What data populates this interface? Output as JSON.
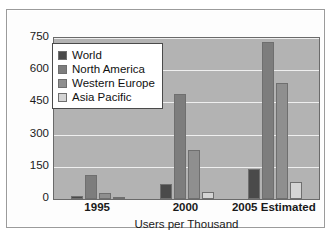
{
  "chart_data": {
    "type": "bar",
    "title": "",
    "xlabel": "Users per Thousand",
    "ylabel": "",
    "categories": [
      "1995",
      "2000",
      "2005 Estimated"
    ],
    "series": [
      {
        "name": "World",
        "color": "#4a4a4a",
        "values": [
          12,
          70,
          140
        ]
      },
      {
        "name": "North America",
        "color": "#7d7d7d",
        "values": [
          110,
          490,
          730
        ]
      },
      {
        "name": "Western Europe",
        "color": "#8f8f8f",
        "values": [
          30,
          230,
          540
        ]
      },
      {
        "name": "Asia Pacific",
        "color": "#d4d4d4",
        "values": [
          8,
          35,
          78
        ]
      }
    ],
    "yticks": [
      0,
      150,
      300,
      450,
      600,
      750
    ],
    "ylim": [
      0,
      750
    ],
    "grid": true,
    "legend_position": "top-left",
    "plot_background": "#b3b3b3",
    "gridline_color": "#efefef"
  }
}
